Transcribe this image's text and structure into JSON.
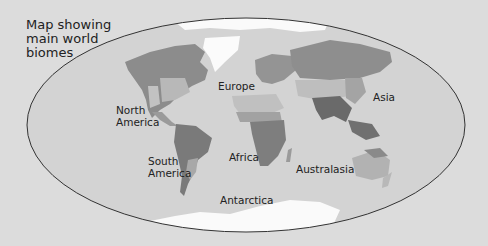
{
  "title": "Map showing main world biomes",
  "title_lines": [
    "Map showing",
    "main world",
    "biomes"
  ],
  "labels": {
    "north_america": [
      "North",
      "America"
    ],
    "south_america": [
      "South",
      "America"
    ],
    "europe": "Europe",
    "africa": "Africa",
    "asia": "Asia",
    "australasia": "Australasia",
    "antarctica": "Antarctica"
  },
  "colors": {
    "background": "#dcdcdc",
    "ocean": "#d2d2d2",
    "ice": "#ffffff",
    "tundra": "#c6c6c6",
    "forest": "#8a8a8a",
    "grassland": "#b4b4b4",
    "desert": "#bebebe",
    "savanna": "#9c9c9c",
    "rainforest": "#6e6e6e",
    "outline": "#333333"
  }
}
